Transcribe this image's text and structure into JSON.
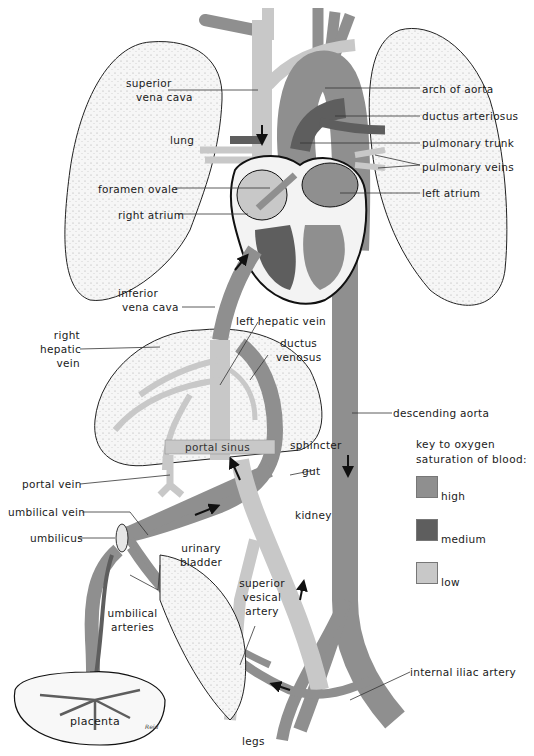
{
  "diagram": {
    "colors": {
      "high": "#8f8f8f",
      "medium": "#5e5e5e",
      "low": "#c8c8c8",
      "organ_fill": "#f3f3f3",
      "outline": "#1a1a1a",
      "background": "#ffffff"
    },
    "labels": {
      "superior_vena_cava_1": "superior",
      "superior_vena_cava_2": "vena cava",
      "lung": "lung",
      "foramen_ovale": "foramen ovale",
      "right_atrium": "right atrium",
      "arch_of_aorta": "arch of aorta",
      "ductus_arteriosus": "ductus arteriosus",
      "pulmonary_trunk": "pulmonary trunk",
      "pulmonary_veins": "pulmonary veins",
      "left_atrium": "left atrium",
      "inferior_vena_cava_1": "inferior",
      "inferior_vena_cava_2": "vena cava",
      "right_hepatic_vein_1": "right",
      "right_hepatic_vein_2": "hepatic",
      "right_hepatic_vein_3": "vein",
      "left_hepatic_vein": "left hepatic vein",
      "ductus_venosus_1": "ductus",
      "ductus_venosus_2": "venosus",
      "descending_aorta": "descending aorta",
      "portal_sinus": "portal sinus",
      "sphincter": "sphincter",
      "portal_vein": "portal vein",
      "gut": "gut",
      "umbilical_vein": "umbilical vein",
      "umbilicus": "umbilicus",
      "kidney": "kidney",
      "urinary_bladder_1": "urinary",
      "urinary_bladder_2": "bladder",
      "superior_vesical_artery_1": "superior",
      "superior_vesical_artery_2": "vesical",
      "superior_vesical_artery_3": "artery",
      "umbilical_arteries_1": "umbilical",
      "umbilical_arteries_2": "arteries",
      "internal_iliac_artery": "internal iliac artery",
      "placenta": "placenta",
      "legs": "legs"
    },
    "key": {
      "title_1": "key to oxygen",
      "title_2": "saturation of blood:",
      "items": [
        {
          "label": "high",
          "color": "#8f8f8f"
        },
        {
          "label": "medium",
          "color": "#5e5e5e"
        },
        {
          "label": "low",
          "color": "#c8c8c8"
        }
      ]
    },
    "signature": "Reid"
  }
}
